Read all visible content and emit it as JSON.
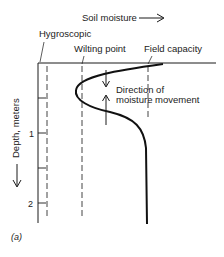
{
  "title": "Soil moisture",
  "x_axis_label": "Soil moisture",
  "y_axis_label": "Depth, meters",
  "y_ticks": [
    "1",
    "2"
  ],
  "y_range_m": [
    0,
    2.2
  ],
  "reference_lines": [
    {
      "name": "hygroscopic",
      "label": "Hygroscopic"
    },
    {
      "name": "wilting-point",
      "label": "Wilting point"
    },
    {
      "name": "field-capacity",
      "label": "Field capacity"
    }
  ],
  "annotation": {
    "line1": "Direction of",
    "line2": "moisture movement"
  },
  "figure_label": "(a)",
  "colors": {
    "ink": "#1a1a1a",
    "dash": "#444444"
  }
}
